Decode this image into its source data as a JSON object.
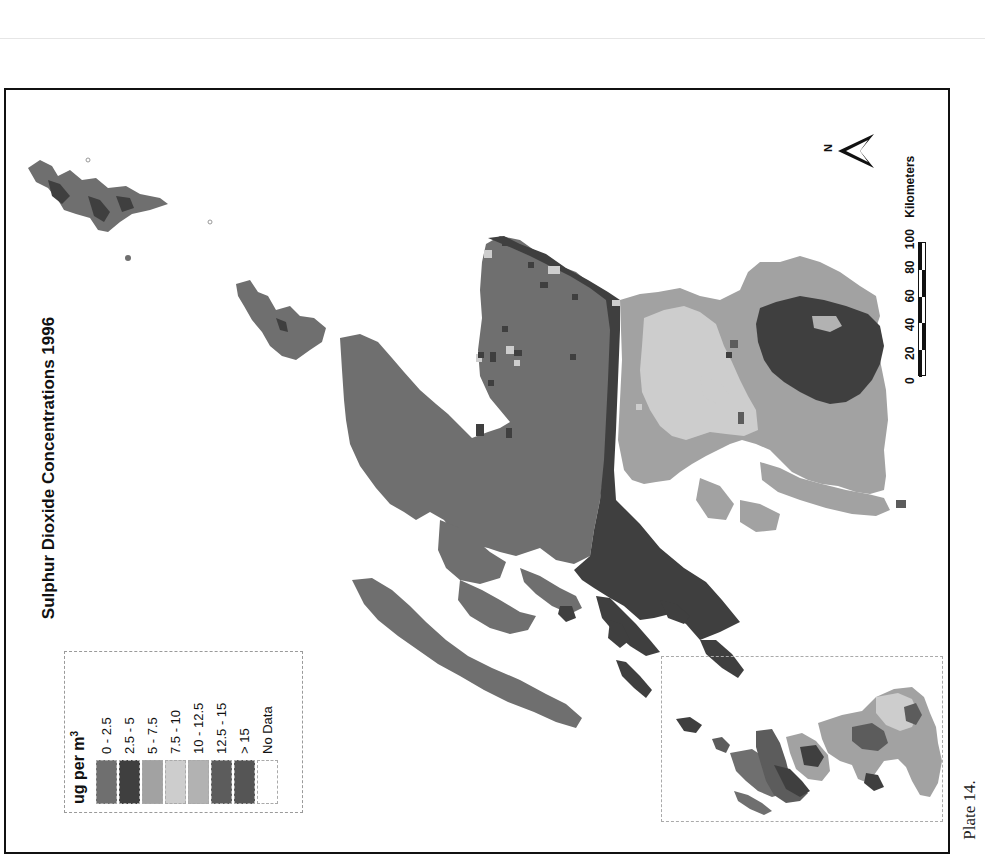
{
  "page": {
    "caption": "Plate 14."
  },
  "map": {
    "title": "Sulphur Dioxide Concentrations 1996",
    "orientation": "rotated 90° counter-clockwise on page",
    "north_arrow_label": "N",
    "scale_bar": {
      "ticks": [
        "0",
        "20",
        "40",
        "60",
        "80",
        "100"
      ],
      "unit": "Kilometers"
    },
    "legend": {
      "title": "ug per m",
      "title_superscript": "3",
      "classes": [
        {
          "label": "0 - 2.5",
          "color": "#6f6f6f"
        },
        {
          "label": "2.5 - 5",
          "color": "#3f3f3f"
        },
        {
          "label": "5 - 7.5",
          "color": "#a2a2a2"
        },
        {
          "label": "7.5 - 10",
          "color": "#cdcdcd"
        },
        {
          "label": "10 - 12.5",
          "color": "#b2b2b2"
        },
        {
          "label": "12.5 - 15",
          "color": "#5c5c5c"
        },
        {
          "label": "> 15",
          "color": "#555555"
        },
        {
          "label": "No Data",
          "color": "#ffffff"
        }
      ]
    },
    "inset_map": {
      "description": "overview locator map"
    }
  }
}
